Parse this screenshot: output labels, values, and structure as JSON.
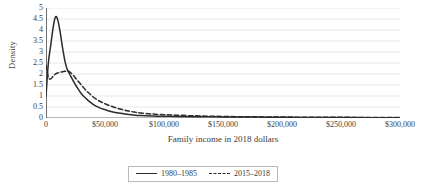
{
  "chart_data": {
    "type": "line",
    "title": "",
    "subtitle": "",
    "xlabel": "Family income in 2018 dollars",
    "ylabel": "Density",
    "xlim": [
      0,
      300000
    ],
    "ylim": [
      0,
      5
    ],
    "grid": "horizontal",
    "legend_position": "bottom-center",
    "x_ticks": [
      {
        "value": 0,
        "label": "0"
      },
      {
        "value": 50000,
        "label": "$50,000"
      },
      {
        "value": 100000,
        "label": "$100,000"
      },
      {
        "value": 150000,
        "label": "$150,000"
      },
      {
        "value": 200000,
        "label": "$200,000"
      },
      {
        "value": 250000,
        "label": "$250,000"
      },
      {
        "value": 300000,
        "label": "$300,000"
      }
    ],
    "y_ticks": [
      {
        "value": 5,
        "label": "5"
      },
      {
        "value": 4.5,
        "label": "4.5"
      },
      {
        "value": 4,
        "label": "4"
      },
      {
        "value": 3.5,
        "label": "3.5"
      },
      {
        "value": 3,
        "label": "3"
      },
      {
        "value": 2.5,
        "label": "2.5"
      },
      {
        "value": 2,
        "label": "2"
      },
      {
        "value": 1.5,
        "label": "1.5"
      },
      {
        "value": 1,
        "label": "1"
      },
      {
        "value": 0.5,
        "label": "0.5"
      },
      {
        "value": 0,
        "label": "0"
      }
    ],
    "axis_color": "#6f6f6f",
    "grid_color": "#e2e2e2",
    "series": [
      {
        "name": "1980–1985",
        "style": "solid",
        "color": "#2b2b2b",
        "x": [
          0,
          2000,
          4000,
          6000,
          8000,
          10000,
          12000,
          14000,
          16000,
          18000,
          20000,
          23000,
          26000,
          30000,
          34000,
          38000,
          42000,
          46000,
          50000,
          55000,
          60000,
          65000,
          70000,
          75000,
          80000,
          90000,
          100000,
          110000,
          125000,
          150000,
          175000,
          200000,
          225000,
          250000,
          275000,
          300000
        ],
        "values": [
          1.0,
          2.5,
          3.3,
          4.1,
          4.6,
          4.45,
          3.9,
          3.2,
          2.6,
          2.2,
          2.0,
          1.7,
          1.42,
          1.1,
          0.88,
          0.7,
          0.55,
          0.45,
          0.38,
          0.3,
          0.24,
          0.2,
          0.16,
          0.13,
          0.11,
          0.09,
          0.08,
          0.07,
          0.06,
          0.05,
          0.04,
          0.03,
          0.025,
          0.02,
          0.015,
          0.012
        ]
      },
      {
        "name": "2015–2018",
        "style": "dashed",
        "color": "#2b2b2b",
        "x": [
          0,
          2000,
          4000,
          6000,
          8000,
          10000,
          12000,
          14000,
          16000,
          18000,
          20000,
          23000,
          26000,
          30000,
          34000,
          38000,
          42000,
          46000,
          50000,
          55000,
          60000,
          65000,
          70000,
          75000,
          80000,
          90000,
          100000,
          110000,
          125000,
          150000,
          175000,
          200000,
          225000,
          250000,
          275000,
          300000
        ],
        "values": [
          2.4,
          1.85,
          1.78,
          1.9,
          2.0,
          2.05,
          2.08,
          2.1,
          2.12,
          2.14,
          2.1,
          1.95,
          1.75,
          1.5,
          1.25,
          1.05,
          0.88,
          0.75,
          0.65,
          0.54,
          0.45,
          0.38,
          0.32,
          0.27,
          0.23,
          0.18,
          0.15,
          0.13,
          0.1,
          0.07,
          0.055,
          0.045,
          0.035,
          0.03,
          0.025,
          0.02
        ]
      }
    ]
  }
}
